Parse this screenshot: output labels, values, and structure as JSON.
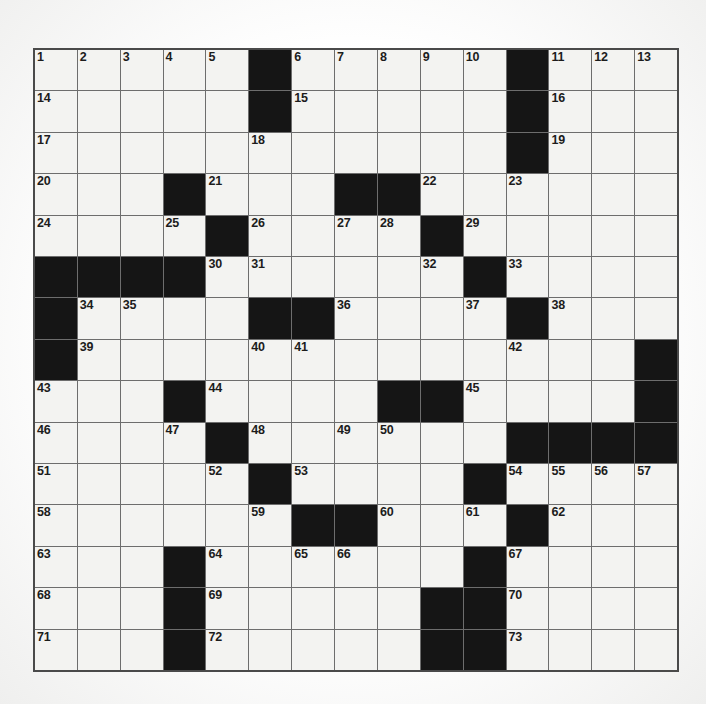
{
  "puzzle": {
    "type": "crossword-grid",
    "title": "",
    "rows": 15,
    "cols": 15,
    "cell_size_px": 43,
    "colors": {
      "block": "#151515",
      "cell": "#f3f3f1",
      "grid_line": "#6d6d6d",
      "border": "#4a4a4a",
      "number_text": "#1c1c1c",
      "page_background": "#ffffff"
    },
    "numbering_scheme": "standard-crossword",
    "highest_number": 73,
    "block_count": 61,
    "grid": [
      [
        {
          "type": "open",
          "number": "1"
        },
        {
          "type": "open",
          "number": "2"
        },
        {
          "type": "open",
          "number": "3"
        },
        {
          "type": "open",
          "number": "4"
        },
        {
          "type": "open",
          "number": "5"
        },
        {
          "type": "block",
          "number": ""
        },
        {
          "type": "open",
          "number": "6"
        },
        {
          "type": "open",
          "number": "7"
        },
        {
          "type": "open",
          "number": "8"
        },
        {
          "type": "open",
          "number": "9"
        },
        {
          "type": "open",
          "number": "10"
        },
        {
          "type": "block",
          "number": ""
        },
        {
          "type": "open",
          "number": "11"
        },
        {
          "type": "open",
          "number": "12"
        },
        {
          "type": "open",
          "number": "13"
        }
      ],
      [
        {
          "type": "open",
          "number": "14"
        },
        {
          "type": "open",
          "number": ""
        },
        {
          "type": "open",
          "number": ""
        },
        {
          "type": "open",
          "number": ""
        },
        {
          "type": "open",
          "number": ""
        },
        {
          "type": "block",
          "number": ""
        },
        {
          "type": "open",
          "number": "15"
        },
        {
          "type": "open",
          "number": ""
        },
        {
          "type": "open",
          "number": ""
        },
        {
          "type": "open",
          "number": ""
        },
        {
          "type": "open",
          "number": ""
        },
        {
          "type": "block",
          "number": ""
        },
        {
          "type": "open",
          "number": "16"
        },
        {
          "type": "open",
          "number": ""
        },
        {
          "type": "open",
          "number": ""
        }
      ],
      [
        {
          "type": "open",
          "number": "17"
        },
        {
          "type": "open",
          "number": ""
        },
        {
          "type": "open",
          "number": ""
        },
        {
          "type": "open",
          "number": ""
        },
        {
          "type": "open",
          "number": ""
        },
        {
          "type": "open",
          "number": "18"
        },
        {
          "type": "open",
          "number": ""
        },
        {
          "type": "open",
          "number": ""
        },
        {
          "type": "open",
          "number": ""
        },
        {
          "type": "open",
          "number": ""
        },
        {
          "type": "open",
          "number": ""
        },
        {
          "type": "block",
          "number": ""
        },
        {
          "type": "open",
          "number": "19"
        },
        {
          "type": "open",
          "number": ""
        },
        {
          "type": "open",
          "number": ""
        }
      ],
      [
        {
          "type": "open",
          "number": "20"
        },
        {
          "type": "open",
          "number": ""
        },
        {
          "type": "open",
          "number": ""
        },
        {
          "type": "block",
          "number": ""
        },
        {
          "type": "open",
          "number": "21"
        },
        {
          "type": "open",
          "number": ""
        },
        {
          "type": "open",
          "number": ""
        },
        {
          "type": "block",
          "number": ""
        },
        {
          "type": "block",
          "number": ""
        },
        {
          "type": "open",
          "number": "22"
        },
        {
          "type": "open",
          "number": ""
        },
        {
          "type": "open",
          "number": "23"
        },
        {
          "type": "open",
          "number": ""
        },
        {
          "type": "open",
          "number": ""
        },
        {
          "type": "open",
          "number": ""
        }
      ],
      [
        {
          "type": "open",
          "number": "24"
        },
        {
          "type": "open",
          "number": ""
        },
        {
          "type": "open",
          "number": ""
        },
        {
          "type": "open",
          "number": "25"
        },
        {
          "type": "block",
          "number": ""
        },
        {
          "type": "open",
          "number": "26"
        },
        {
          "type": "open",
          "number": ""
        },
        {
          "type": "open",
          "number": "27"
        },
        {
          "type": "open",
          "number": "28"
        },
        {
          "type": "block",
          "number": ""
        },
        {
          "type": "open",
          "number": "29"
        },
        {
          "type": "open",
          "number": ""
        },
        {
          "type": "open",
          "number": ""
        },
        {
          "type": "open",
          "number": ""
        },
        {
          "type": "open",
          "number": ""
        }
      ],
      [
        {
          "type": "block",
          "number": ""
        },
        {
          "type": "block",
          "number": ""
        },
        {
          "type": "block",
          "number": ""
        },
        {
          "type": "block",
          "number": ""
        },
        {
          "type": "open",
          "number": "30"
        },
        {
          "type": "open",
          "number": "31"
        },
        {
          "type": "open",
          "number": ""
        },
        {
          "type": "open",
          "number": ""
        },
        {
          "type": "open",
          "number": ""
        },
        {
          "type": "open",
          "number": "32"
        },
        {
          "type": "block",
          "number": ""
        },
        {
          "type": "open",
          "number": "33"
        },
        {
          "type": "open",
          "number": ""
        },
        {
          "type": "open",
          "number": ""
        },
        {
          "type": "open",
          "number": ""
        }
      ],
      [
        {
          "type": "block",
          "number": ""
        },
        {
          "type": "open",
          "number": "34"
        },
        {
          "type": "open",
          "number": "35"
        },
        {
          "type": "open",
          "number": ""
        },
        {
          "type": "open",
          "number": ""
        },
        {
          "type": "block",
          "number": ""
        },
        {
          "type": "block",
          "number": ""
        },
        {
          "type": "open",
          "number": "36"
        },
        {
          "type": "open",
          "number": ""
        },
        {
          "type": "open",
          "number": ""
        },
        {
          "type": "open",
          "number": "37"
        },
        {
          "type": "block",
          "number": ""
        },
        {
          "type": "open",
          "number": "38"
        },
        {
          "type": "open",
          "number": ""
        },
        {
          "type": "open",
          "number": ""
        }
      ],
      [
        {
          "type": "block",
          "number": ""
        },
        {
          "type": "open",
          "number": "39"
        },
        {
          "type": "open",
          "number": ""
        },
        {
          "type": "open",
          "number": ""
        },
        {
          "type": "open",
          "number": ""
        },
        {
          "type": "open",
          "number": "40"
        },
        {
          "type": "open",
          "number": "41"
        },
        {
          "type": "open",
          "number": ""
        },
        {
          "type": "open",
          "number": ""
        },
        {
          "type": "open",
          "number": ""
        },
        {
          "type": "open",
          "number": ""
        },
        {
          "type": "open",
          "number": "42"
        },
        {
          "type": "open",
          "number": ""
        },
        {
          "type": "open",
          "number": ""
        },
        {
          "type": "block",
          "number": ""
        }
      ],
      [
        {
          "type": "open",
          "number": "43"
        },
        {
          "type": "open",
          "number": ""
        },
        {
          "type": "open",
          "number": ""
        },
        {
          "type": "block",
          "number": ""
        },
        {
          "type": "open",
          "number": "44"
        },
        {
          "type": "open",
          "number": ""
        },
        {
          "type": "open",
          "number": ""
        },
        {
          "type": "open",
          "number": ""
        },
        {
          "type": "block",
          "number": ""
        },
        {
          "type": "block",
          "number": ""
        },
        {
          "type": "open",
          "number": "45"
        },
        {
          "type": "open",
          "number": ""
        },
        {
          "type": "open",
          "number": ""
        },
        {
          "type": "open",
          "number": ""
        },
        {
          "type": "block",
          "number": ""
        }
      ],
      [
        {
          "type": "open",
          "number": "46"
        },
        {
          "type": "open",
          "number": ""
        },
        {
          "type": "open",
          "number": ""
        },
        {
          "type": "open",
          "number": "47"
        },
        {
          "type": "block",
          "number": ""
        },
        {
          "type": "open",
          "number": "48"
        },
        {
          "type": "open",
          "number": ""
        },
        {
          "type": "open",
          "number": "49"
        },
        {
          "type": "open",
          "number": "50"
        },
        {
          "type": "open",
          "number": ""
        },
        {
          "type": "open",
          "number": ""
        },
        {
          "type": "block",
          "number": ""
        },
        {
          "type": "block",
          "number": ""
        },
        {
          "type": "block",
          "number": ""
        },
        {
          "type": "block",
          "number": ""
        }
      ],
      [
        {
          "type": "open",
          "number": "51"
        },
        {
          "type": "open",
          "number": ""
        },
        {
          "type": "open",
          "number": ""
        },
        {
          "type": "open",
          "number": ""
        },
        {
          "type": "open",
          "number": "52"
        },
        {
          "type": "block",
          "number": ""
        },
        {
          "type": "open",
          "number": "53"
        },
        {
          "type": "open",
          "number": ""
        },
        {
          "type": "open",
          "number": ""
        },
        {
          "type": "open",
          "number": ""
        },
        {
          "type": "block",
          "number": ""
        },
        {
          "type": "open",
          "number": "54"
        },
        {
          "type": "open",
          "number": "55"
        },
        {
          "type": "open",
          "number": "56"
        },
        {
          "type": "open",
          "number": "57"
        }
      ],
      [
        {
          "type": "open",
          "number": "58"
        },
        {
          "type": "open",
          "number": ""
        },
        {
          "type": "open",
          "number": ""
        },
        {
          "type": "open",
          "number": ""
        },
        {
          "type": "open",
          "number": ""
        },
        {
          "type": "open",
          "number": "59"
        },
        {
          "type": "block",
          "number": ""
        },
        {
          "type": "block",
          "number": ""
        },
        {
          "type": "open",
          "number": "60"
        },
        {
          "type": "open",
          "number": ""
        },
        {
          "type": "open",
          "number": "61"
        },
        {
          "type": "block",
          "number": ""
        },
        {
          "type": "open",
          "number": "62"
        },
        {
          "type": "open",
          "number": ""
        },
        {
          "type": "open",
          "number": ""
        }
      ],
      [
        {
          "type": "open",
          "number": "63"
        },
        {
          "type": "open",
          "number": ""
        },
        {
          "type": "open",
          "number": ""
        },
        {
          "type": "block",
          "number": ""
        },
        {
          "type": "open",
          "number": "64"
        },
        {
          "type": "open",
          "number": ""
        },
        {
          "type": "open",
          "number": "65"
        },
        {
          "type": "open",
          "number": "66"
        },
        {
          "type": "open",
          "number": ""
        },
        {
          "type": "open",
          "number": ""
        },
        {
          "type": "block",
          "number": ""
        },
        {
          "type": "open",
          "number": "67"
        },
        {
          "type": "open",
          "number": ""
        },
        {
          "type": "open",
          "number": ""
        },
        {
          "type": "open",
          "number": ""
        }
      ],
      [
        {
          "type": "open",
          "number": "68"
        },
        {
          "type": "open",
          "number": ""
        },
        {
          "type": "open",
          "number": ""
        },
        {
          "type": "block",
          "number": ""
        },
        {
          "type": "open",
          "number": "69"
        },
        {
          "type": "open",
          "number": ""
        },
        {
          "type": "open",
          "number": ""
        },
        {
          "type": "open",
          "number": ""
        },
        {
          "type": "open",
          "number": ""
        },
        {
          "type": "block",
          "number": ""
        },
        {
          "type": "block",
          "number": ""
        },
        {
          "type": "open",
          "number": "70"
        },
        {
          "type": "open",
          "number": ""
        },
        {
          "type": "open",
          "number": ""
        },
        {
          "type": "open",
          "number": ""
        }
      ],
      [
        {
          "type": "open",
          "number": "71"
        },
        {
          "type": "open",
          "number": ""
        },
        {
          "type": "open",
          "number": ""
        },
        {
          "type": "block",
          "number": ""
        },
        {
          "type": "open",
          "number": "72"
        },
        {
          "type": "open",
          "number": ""
        },
        {
          "type": "open",
          "number": ""
        },
        {
          "type": "open",
          "number": ""
        },
        {
          "type": "open",
          "number": ""
        },
        {
          "type": "block",
          "number": ""
        },
        {
          "type": "block",
          "number": ""
        },
        {
          "type": "open",
          "number": "73"
        },
        {
          "type": "open",
          "number": ""
        },
        {
          "type": "open",
          "number": ""
        },
        {
          "type": "open",
          "number": ""
        }
      ]
    ]
  }
}
